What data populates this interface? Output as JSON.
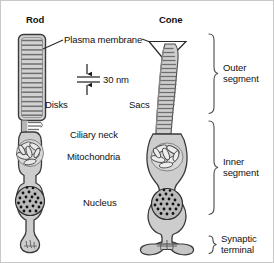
{
  "figure": {
    "title_rod": "Rod",
    "title_cone": "Cone",
    "labels": {
      "plasma_membrane": "Plasma membrane",
      "scale_bar": "30 nm",
      "disks": "Disks",
      "sacs": "Sacs",
      "ciliary_neck": "Ciliary neck",
      "mitochondria": "Mitochondria",
      "nucleus": "Nucleus",
      "outer_segment_line1": "Outer",
      "outer_segment_line2": "segment",
      "inner_segment_line1": "Inner",
      "inner_segment_line2": "segment",
      "synaptic_terminal_line1": "Synaptic",
      "synaptic_terminal_line2": "terminal"
    },
    "colors": {
      "background": "#ffffff",
      "outline": "#3c3c3c",
      "cell_fill": "#c9c9c9",
      "cell_fill_light": "#d6d6d6",
      "disk_line": "#8a8a8a",
      "nucleus_fill": "#b4b4b4",
      "nucleus_dot": "#111111",
      "text": "#111111",
      "border": "#c8c8c8"
    },
    "measurements": {
      "scale_value": 30,
      "scale_unit": "nm"
    }
  }
}
